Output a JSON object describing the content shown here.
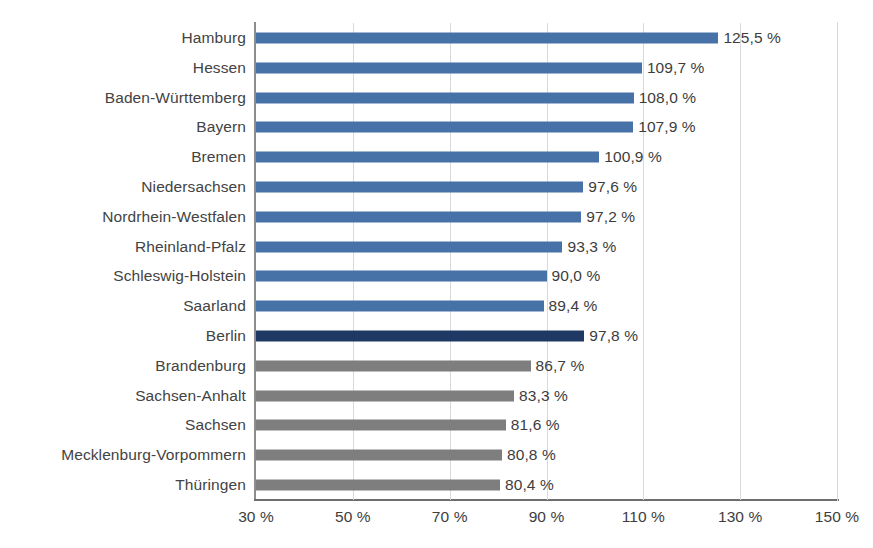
{
  "chart_data": {
    "type": "bar",
    "orientation": "horizontal",
    "title": "",
    "xlabel": "",
    "ylabel": "",
    "xlim": [
      30,
      150
    ],
    "xticks": [
      30,
      50,
      70,
      90,
      110,
      130,
      150
    ],
    "xtick_labels": [
      "30 %",
      "50 %",
      "70 %",
      "90 %",
      "110 %",
      "130 %",
      "150 %"
    ],
    "grid": true,
    "gridlines_axis": "x",
    "legend": "none",
    "value_suffix": " %",
    "decimal_separator": ",",
    "categories": [
      "Hamburg",
      "Hessen",
      "Baden-Württemberg",
      "Bayern",
      "Bremen",
      "Niedersachsen",
      "Nordrhein-Westfalen",
      "Rheinland-Pfalz",
      "Schleswig-Holstein",
      "Saarland",
      "Berlin",
      "Brandenburg",
      "Sachsen-Anhalt",
      "Sachsen",
      "Mecklenburg-Vorpommern",
      "Thüringen"
    ],
    "values": [
      125.5,
      109.7,
      108.0,
      107.9,
      100.9,
      97.6,
      97.2,
      93.3,
      90.0,
      89.4,
      97.8,
      86.7,
      83.3,
      81.6,
      80.8,
      80.4
    ],
    "value_labels": [
      "125,5 %",
      "109,7 %",
      "108,0 %",
      "107,9 %",
      "100,9 %",
      "97,6 %",
      "97,2 %",
      "93,3 %",
      "90,0 %",
      "89,4 %",
      "97,8 %",
      "86,7 %",
      "83,3 %",
      "81,6 %",
      "80,8 %",
      "80,4 %"
    ],
    "bar_colors": [
      "blue",
      "blue",
      "blue",
      "blue",
      "blue",
      "blue",
      "blue",
      "blue",
      "blue",
      "blue",
      "dark-blue",
      "grey",
      "grey",
      "grey",
      "grey",
      "grey"
    ],
    "colors": {
      "blue": "#4672a8",
      "dark-blue": "#203864",
      "grey": "#7e7e7e",
      "gridline": "#d9d9dd",
      "axis": "#7a7a7a",
      "text": "#3d3d3d"
    },
    "bars": [
      {
        "category": "Hamburg",
        "value": 125.5,
        "label": "125,5 %",
        "color": "blue"
      },
      {
        "category": "Hessen",
        "value": 109.7,
        "label": "109,7 %",
        "color": "blue"
      },
      {
        "category": "Baden-Württemberg",
        "value": 108.0,
        "label": "108,0 %",
        "color": "blue"
      },
      {
        "category": "Bayern",
        "value": 107.9,
        "label": "107,9 %",
        "color": "blue"
      },
      {
        "category": "Bremen",
        "value": 100.9,
        "label": "100,9 %",
        "color": "blue"
      },
      {
        "category": "Niedersachsen",
        "value": 97.6,
        "label": "97,6 %",
        "color": "blue"
      },
      {
        "category": "Nordrhein-Westfalen",
        "value": 97.2,
        "label": "97,2 %",
        "color": "blue"
      },
      {
        "category": "Rheinland-Pfalz",
        "value": 93.3,
        "label": "93,3 %",
        "color": "blue"
      },
      {
        "category": "Schleswig-Holstein",
        "value": 90.0,
        "label": "90,0 %",
        "color": "blue"
      },
      {
        "category": "Saarland",
        "value": 89.4,
        "label": "89,4 %",
        "color": "blue"
      },
      {
        "category": "Berlin",
        "value": 97.8,
        "label": "97,8 %",
        "color": "dark-blue"
      },
      {
        "category": "Brandenburg",
        "value": 86.7,
        "label": "86,7 %",
        "color": "grey"
      },
      {
        "category": "Sachsen-Anhalt",
        "value": 83.3,
        "label": "83,3 %",
        "color": "grey"
      },
      {
        "category": "Sachsen",
        "value": 81.6,
        "label": "81,6 %",
        "color": "grey"
      },
      {
        "category": "Mecklenburg-Vorpommern",
        "value": 80.8,
        "label": "80,8 %",
        "color": "grey"
      },
      {
        "category": "Thüringen",
        "value": 80.4,
        "label": "80,4 %",
        "color": "grey"
      }
    ]
  }
}
